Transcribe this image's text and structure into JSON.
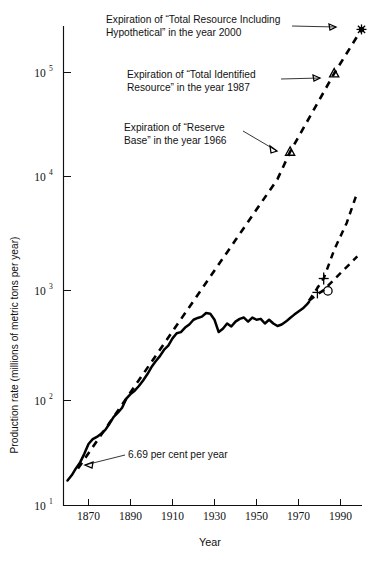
{
  "chart_data": {
    "type": "line",
    "title": "",
    "xlabel": "Year",
    "ylabel": "Production rate (millions of metric tons per year)",
    "yscale": "log",
    "xlim": [
      1858,
      2002
    ],
    "ylim": [
      10,
      300000
    ],
    "grid": false,
    "legend": "none",
    "xticks": [
      "1870",
      "1890",
      "1910",
      "1930",
      "1950",
      "1970",
      "1990"
    ],
    "ytick_labels": [
      "10^1",
      "10^2",
      "10^3",
      "10^4",
      "10^5"
    ],
    "ytick_mantissa": [
      "10",
      "10",
      "10",
      "10",
      "10"
    ],
    "ytick_exponents": [
      "1",
      "2",
      "3",
      "4",
      "5"
    ],
    "ytick_values": [
      10,
      100,
      1000,
      10000,
      100000
    ],
    "series": [
      {
        "name": "Historical production rate",
        "style": "solid",
        "points": [
          [
            1860,
            17
          ],
          [
            1862,
            19
          ],
          [
            1864,
            22
          ],
          [
            1866,
            25
          ],
          [
            1868,
            30
          ],
          [
            1870,
            37
          ],
          [
            1872,
            41
          ],
          [
            1874,
            43
          ],
          [
            1876,
            46
          ],
          [
            1878,
            50
          ],
          [
            1880,
            57
          ],
          [
            1882,
            66
          ],
          [
            1884,
            72
          ],
          [
            1886,
            80
          ],
          [
            1888,
            97
          ],
          [
            1890,
            107
          ],
          [
            1892,
            115
          ],
          [
            1894,
            127
          ],
          [
            1896,
            143
          ],
          [
            1898,
            163
          ],
          [
            1900,
            190
          ],
          [
            1902,
            215
          ],
          [
            1904,
            240
          ],
          [
            1906,
            275
          ],
          [
            1908,
            300
          ],
          [
            1910,
            350
          ],
          [
            1912,
            390
          ],
          [
            1914,
            400
          ],
          [
            1916,
            440
          ],
          [
            1918,
            470
          ],
          [
            1920,
            520
          ],
          [
            1922,
            540
          ],
          [
            1924,
            555
          ],
          [
            1926,
            600
          ],
          [
            1928,
            590
          ],
          [
            1930,
            520
          ],
          [
            1932,
            400
          ],
          [
            1934,
            430
          ],
          [
            1936,
            480
          ],
          [
            1938,
            450
          ],
          [
            1940,
            500
          ],
          [
            1942,
            530
          ],
          [
            1944,
            545
          ],
          [
            1946,
            500
          ],
          [
            1948,
            545
          ],
          [
            1950,
            520
          ],
          [
            1952,
            530
          ],
          [
            1954,
            480
          ],
          [
            1956,
            520
          ],
          [
            1958,
            480
          ],
          [
            1960,
            455
          ],
          [
            1962,
            470
          ],
          [
            1964,
            500
          ],
          [
            1966,
            540
          ],
          [
            1968,
            580
          ],
          [
            1970,
            620
          ],
          [
            1972,
            660
          ],
          [
            1974,
            720
          ],
          [
            1975,
            760
          ]
        ]
      },
      {
        "name": "6.69 per cent per year exponential projection",
        "style": "dashed",
        "points": [
          [
            1865,
            22
          ],
          [
            1880,
            58
          ],
          [
            1900,
            212
          ],
          [
            1920,
            775
          ],
          [
            1940,
            2830
          ],
          [
            1960,
            10350
          ],
          [
            1966,
            18500
          ],
          [
            1987,
            98000
          ],
          [
            2000,
            250000
          ]
        ]
      },
      {
        "name": "Upper alternate projection",
        "style": "dashed",
        "points": [
          [
            1975,
            780
          ],
          [
            1982,
            1250
          ],
          [
            1987,
            2300
          ],
          [
            1993,
            4100
          ],
          [
            1998,
            7800
          ]
        ]
      },
      {
        "name": "Lower alternate projection",
        "style": "dashed",
        "points": [
          [
            1975,
            780
          ],
          [
            1982,
            980
          ],
          [
            1990,
            1400
          ],
          [
            1998,
            2000
          ]
        ]
      }
    ],
    "markers": [
      {
        "name": "reserve-base-expiration",
        "symbol": "triangle",
        "year": 1966,
        "value": 18500
      },
      {
        "name": "total-identified-resource-expiration",
        "symbol": "triangle",
        "year": 1987,
        "value": 98000
      },
      {
        "name": "total-resource-including-hypothetical-expiration",
        "symbol": "star",
        "year": 2000,
        "value": 250000
      },
      {
        "name": "upper-projection-marker",
        "symbol": "cross",
        "year": 1982,
        "value": 1250
      },
      {
        "name": "lower-projection-marker-cross",
        "symbol": "cross",
        "year": 1979,
        "value": 930
      },
      {
        "name": "lower-projection-marker-circle",
        "symbol": "circle",
        "year": 1984,
        "value": 960
      }
    ],
    "annotations": [
      {
        "name": "annotation-total-resource-hypothetical",
        "line1": "Expiration of “Total Resource Including",
        "line2": "Hypothetical” in the year 2000",
        "target_year": 2000,
        "target_value": 250000
      },
      {
        "name": "annotation-total-identified-resource",
        "line1": "Expiration of “Total Identified",
        "line2": "Resource” in the year 1987",
        "target_year": 1987,
        "target_value": 98000
      },
      {
        "name": "annotation-reserve-base",
        "line1": "Expiration of “Reserve",
        "line2": "Base” in the year 1966",
        "target_year": 1966,
        "target_value": 18500
      },
      {
        "name": "annotation-growth-rate",
        "line1": "6.69 per cent per year",
        "line2": "",
        "target_year": 1871,
        "target_value": 38
      }
    ]
  }
}
